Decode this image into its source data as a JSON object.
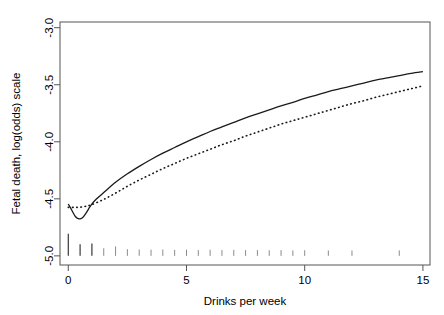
{
  "chart_data": {
    "type": "line",
    "title": "",
    "xlabel": "Drinks per week",
    "ylabel": "Fetal death, log(odds) scale",
    "xlim": [
      -0.35,
      15.3
    ],
    "ylim": [
      -5.08,
      -2.95
    ],
    "xticks": [
      0,
      5,
      10,
      15
    ],
    "xtick_labels": [
      "0",
      "5",
      "10",
      "15"
    ],
    "yticks": [
      -3.0,
      -3.5,
      -4.0,
      -4.5,
      -5.0
    ],
    "ytick_labels": [
      "-3.0",
      "-3.5",
      "-4.0",
      "-4.5",
      "-5.0"
    ],
    "grid": false,
    "legend": "none",
    "series": [
      {
        "name": "spline fit",
        "style": "solid",
        "color": "#1a1a1a",
        "x": [
          0.0,
          0.15,
          0.3,
          0.45,
          0.6,
          0.75,
          0.9,
          1.0,
          1.2,
          1.5,
          2.0,
          2.5,
          3.0,
          3.5,
          4.0,
          4.5,
          5.0,
          5.5,
          6.0,
          6.5,
          7.0,
          7.5,
          8.0,
          8.5,
          9.0,
          9.5,
          10.0,
          10.5,
          11.0,
          11.5,
          12.0,
          12.5,
          13.0,
          13.5,
          14.0,
          14.5,
          15.0
        ],
        "y": [
          -4.545,
          -4.6,
          -4.655,
          -4.675,
          -4.665,
          -4.625,
          -4.575,
          -4.545,
          -4.5,
          -4.445,
          -4.355,
          -4.28,
          -4.215,
          -4.155,
          -4.1,
          -4.05,
          -4.0,
          -3.955,
          -3.91,
          -3.87,
          -3.83,
          -3.79,
          -3.755,
          -3.72,
          -3.685,
          -3.655,
          -3.62,
          -3.59,
          -3.56,
          -3.535,
          -3.51,
          -3.485,
          -3.46,
          -3.44,
          -3.42,
          -3.4,
          -3.385
        ]
      },
      {
        "name": "smooth fit",
        "style": "dotted",
        "color": "#1a1a1a",
        "x": [
          0.0,
          0.25,
          0.5,
          0.75,
          1.0,
          1.5,
          2.0,
          2.5,
          3.0,
          3.5,
          4.0,
          4.5,
          5.0,
          5.5,
          6.0,
          6.5,
          7.0,
          7.5,
          8.0,
          8.5,
          9.0,
          9.5,
          10.0,
          10.5,
          11.0,
          11.5,
          12.0,
          12.5,
          13.0,
          13.5,
          14.0,
          14.5,
          15.0
        ],
        "y": [
          -4.575,
          -4.575,
          -4.573,
          -4.565,
          -4.55,
          -4.505,
          -4.45,
          -4.39,
          -4.335,
          -4.285,
          -4.235,
          -4.19,
          -4.145,
          -4.105,
          -4.065,
          -4.025,
          -3.99,
          -3.95,
          -3.915,
          -3.88,
          -3.845,
          -3.815,
          -3.785,
          -3.755,
          -3.725,
          -3.695,
          -3.665,
          -3.64,
          -3.61,
          -3.585,
          -3.56,
          -3.535,
          -3.51
        ]
      }
    ],
    "rug": {
      "name": "data-rug",
      "y_base": -5.0,
      "marks": [
        {
          "x": 0.0,
          "height": 1.0
        },
        {
          "x": 0.5,
          "height": 0.42
        },
        {
          "x": 1.0,
          "height": 0.46
        },
        {
          "x": 1.5,
          "height": 0.2
        },
        {
          "x": 2.0,
          "height": 0.3
        },
        {
          "x": 2.5,
          "height": 0.15
        },
        {
          "x": 3.0,
          "height": 0.13
        },
        {
          "x": 3.5,
          "height": 0.12
        },
        {
          "x": 4.0,
          "height": 0.13
        },
        {
          "x": 4.5,
          "height": 0.11
        },
        {
          "x": 5.0,
          "height": 0.12
        },
        {
          "x": 5.5,
          "height": 0.1
        },
        {
          "x": 6.0,
          "height": 0.12
        },
        {
          "x": 6.5,
          "height": 0.1
        },
        {
          "x": 7.0,
          "height": 0.11
        },
        {
          "x": 7.5,
          "height": 0.1
        },
        {
          "x": 8.0,
          "height": 0.1
        },
        {
          "x": 8.5,
          "height": 0.09
        },
        {
          "x": 9.0,
          "height": 0.1
        },
        {
          "x": 9.5,
          "height": 0.08
        },
        {
          "x": 10.0,
          "height": 0.09
        },
        {
          "x": 11.0,
          "height": 0.08
        },
        {
          "x": 12.0,
          "height": 0.08
        },
        {
          "x": 14.0,
          "height": 0.08
        }
      ]
    }
  }
}
